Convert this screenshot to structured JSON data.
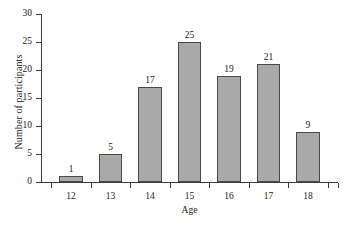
{
  "chart_data": {
    "type": "bar",
    "title": "",
    "xlabel": "Age",
    "ylabel": "Number of participants",
    "categories": [
      "12",
      "13",
      "14",
      "15",
      "16",
      "17",
      "18"
    ],
    "values": [
      1,
      5,
      17,
      25,
      19,
      21,
      9
    ],
    "value_labels": [
      "1",
      "5",
      "17",
      "25",
      "19",
      "21",
      "9"
    ],
    "ylim": [
      0,
      30
    ],
    "ytick_labels": [
      "0",
      "5",
      "10",
      "15",
      "20",
      "25",
      "30"
    ],
    "ytick_values": [
      0,
      5,
      10,
      15,
      20,
      25,
      30
    ],
    "grid": false,
    "legend": "none",
    "bar_color": "#a9a9a9",
    "bar_edge_color": "#4a4a4a",
    "axis_color": "#3c3c3c",
    "background": "#ffffff"
  }
}
